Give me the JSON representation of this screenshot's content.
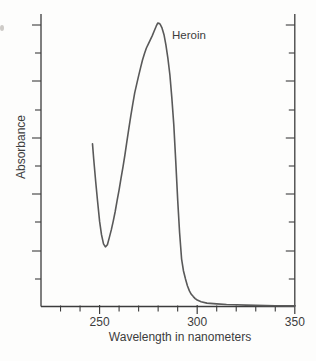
{
  "chart_data": {
    "type": "line",
    "title": "",
    "xlabel": "Wavelength in nanometers",
    "ylabel": "Absorbance",
    "annotation": "Heroin",
    "xlim": [
      220,
      350
    ],
    "ylim": [
      0,
      1.05
    ],
    "grid": false,
    "legend_position": "annotation-near-peak",
    "x_ticks_minor": [
      230,
      240,
      260,
      270,
      280,
      290,
      310,
      320,
      330,
      340
    ],
    "x_ticks_major": [
      250,
      300,
      350
    ],
    "x_tick_labels": [
      "250",
      "300",
      "350"
    ],
    "y_ticks_unlabeled": true,
    "colors": {
      "curve": "#595959",
      "axis": "#3c3c3c",
      "text": "#3c3c3c",
      "background": "#fdfdfc"
    },
    "series": [
      {
        "name": "Heroin",
        "x_units": "nm",
        "y_units": "absorbance (arbitrary, normalized to peak = 1)",
        "peak_nm": 280,
        "valley_nm": 253,
        "points": [
          [
            246.4,
            0.573
          ],
          [
            247,
            0.52
          ],
          [
            248,
            0.44
          ],
          [
            249,
            0.37
          ],
          [
            250,
            0.3
          ],
          [
            251,
            0.253
          ],
          [
            252,
            0.221
          ],
          [
            253,
            0.21
          ],
          [
            254,
            0.218
          ],
          [
            255,
            0.243
          ],
          [
            256,
            0.27
          ],
          [
            257,
            0.3
          ],
          [
            258,
            0.335
          ],
          [
            259,
            0.373
          ],
          [
            260,
            0.411
          ],
          [
            261,
            0.452
          ],
          [
            262,
            0.492
          ],
          [
            263,
            0.534
          ],
          [
            264,
            0.582
          ],
          [
            265,
            0.629
          ],
          [
            266,
            0.672
          ],
          [
            267,
            0.714
          ],
          [
            268,
            0.753
          ],
          [
            269,
            0.784
          ],
          [
            270,
            0.813
          ],
          [
            271,
            0.842
          ],
          [
            272,
            0.869
          ],
          [
            273,
            0.892
          ],
          [
            274,
            0.911
          ],
          [
            275,
            0.926
          ],
          [
            276,
            0.94
          ],
          [
            277,
            0.955
          ],
          [
            278,
            0.971
          ],
          [
            279,
            0.988
          ],
          [
            279.8,
            0.999
          ],
          [
            280.5,
            0.998
          ],
          [
            281,
            0.995
          ],
          [
            282,
            0.982
          ],
          [
            283,
            0.958
          ],
          [
            284,
            0.922
          ],
          [
            285,
            0.875
          ],
          [
            286,
            0.816
          ],
          [
            287,
            0.737
          ],
          [
            288,
            0.64
          ],
          [
            289,
            0.515
          ],
          [
            290,
            0.375
          ],
          [
            291,
            0.26
          ],
          [
            292,
            0.167
          ],
          [
            293,
            0.125
          ],
          [
            294,
            0.097
          ],
          [
            295,
            0.073
          ],
          [
            296,
            0.055
          ],
          [
            297,
            0.043
          ],
          [
            298,
            0.035
          ],
          [
            299,
            0.028
          ],
          [
            300,
            0.023
          ],
          [
            302,
            0.017
          ],
          [
            305,
            0.012
          ],
          [
            310,
            0.009
          ],
          [
            315,
            0.007
          ],
          [
            320,
            0.006
          ],
          [
            325,
            0.005
          ],
          [
            330,
            0.004
          ],
          [
            335,
            0.003
          ],
          [
            340,
            0.0025
          ],
          [
            345,
            0.002
          ],
          [
            350,
            0.002
          ]
        ]
      }
    ],
    "layout_px": {
      "x_left": 41,
      "x_right": 294.8,
      "y_base": 306.5,
      "y_peak": 22.8,
      "y_top": 14,
      "y_ticks": [
        25,
        53,
        81,
        110,
        138,
        166,
        194,
        222,
        251,
        279
      ],
      "left_tick_long": 9,
      "left_tick_short": 6,
      "right_tick_long": 9,
      "right_tick_short": 6,
      "x_tick_minor_len": 5,
      "x_tick_major_len": 7.5
    }
  }
}
